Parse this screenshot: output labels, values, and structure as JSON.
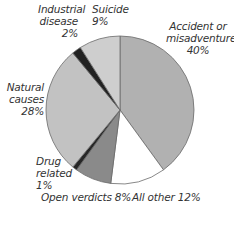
{
  "chart_data": {
    "type": "pie",
    "title": "",
    "start_angle_deg": 0,
    "direction": "clockwise",
    "center": [
      120,
      110
    ],
    "radius": 74,
    "slices": [
      {
        "name": "Accident or misadventure",
        "value": 40,
        "color": "#b1b1b1",
        "label_lines": [
          "Accident or",
          "misadventure",
          "40%"
        ]
      },
      {
        "name": "All other",
        "value": 12,
        "color": "#ffffff",
        "label_lines": [
          "All other 12%"
        ]
      },
      {
        "name": "Open verdicts",
        "value": 8,
        "color": "#8a8a8a",
        "label_lines": [
          "Open verdicts 8%"
        ]
      },
      {
        "name": "Drug related",
        "value": 1,
        "color": "#262626",
        "label_lines": [
          "Drug",
          "related",
          "1%"
        ]
      },
      {
        "name": "Natural causes",
        "value": 28,
        "color": "#c2c2c2",
        "label_lines": [
          "Natural",
          "causes",
          "28%"
        ]
      },
      {
        "name": "Industrial disease",
        "value": 2,
        "color": "#222222",
        "label_lines": [
          "Industrial",
          "disease",
          "2%"
        ]
      },
      {
        "name": "Suicide",
        "value": 9,
        "color": "#cecece",
        "label_lines": [
          "Suicide",
          "9%"
        ]
      }
    ],
    "outline_color": "#6a6a6a"
  },
  "labels": {
    "accident": {
      "l1": "Accident or",
      "l2": "misadventure",
      "l3": "40%"
    },
    "all_other": {
      "l1": "All other 12%"
    },
    "open_verdicts": {
      "l1": "Open verdicts 8%"
    },
    "drug": {
      "l1": "Drug",
      "l2": "related",
      "l3": "1%"
    },
    "natural": {
      "l1": "Natural",
      "l2": "causes",
      "l3": "28%"
    },
    "industrial": {
      "l1": "Industrial",
      "l2": "disease",
      "l3": "2%"
    },
    "suicide": {
      "l1": "Suicide",
      "l2": "9%"
    }
  }
}
